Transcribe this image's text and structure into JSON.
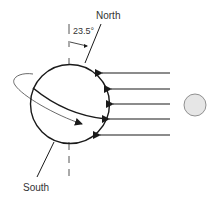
{
  "diagram": {
    "labels": {
      "north": "North",
      "south": "South",
      "tilt_angle": "23.5°"
    },
    "colors": {
      "stroke": "#1a1a1a",
      "sun_fill": "#e6e6e6",
      "sun_stroke": "#777777",
      "text": "#333333"
    },
    "elements": {
      "earth": "circle",
      "sun": "circle",
      "sun_rays": 5,
      "axis": "tilted rotation axis",
      "vertical_reference": "dashed vertical line",
      "equator": "curved line",
      "rotation_orbit": "elliptical arrow"
    }
  }
}
